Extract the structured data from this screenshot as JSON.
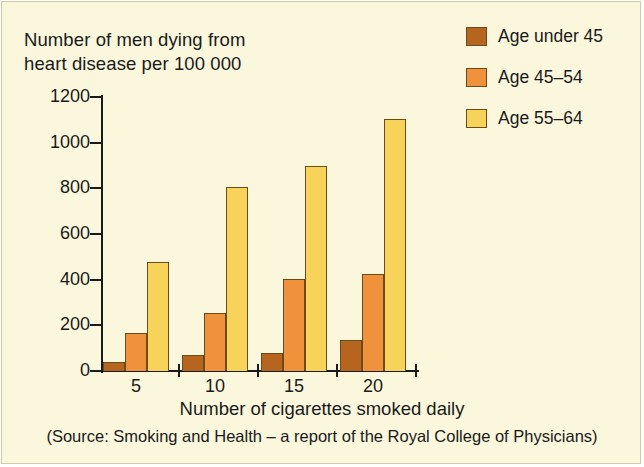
{
  "figure": {
    "background_color": "#faf7dd",
    "border_color": "#cfcaa8"
  },
  "legend": {
    "items": [
      {
        "label": "Age under 45",
        "color": "#b5651d",
        "swatch_name": "legend-swatch-age-under-45"
      },
      {
        "label": "Age 45–54",
        "color": "#f0913c",
        "swatch_name": "legend-swatch-age-45-54"
      },
      {
        "label": "Age 55–64",
        "color": "#f7d359",
        "swatch_name": "legend-swatch-age-55-64"
      }
    ]
  },
  "captions": {
    "y_title_line1": "Number of men dying from",
    "y_title_line2": "heart disease per 100 000",
    "x_title": "Number of cigarettes smoked daily",
    "source": "(Source: Smoking and Health – a report of the Royal College of Physicians)"
  },
  "chart_data": {
    "type": "bar",
    "title": "Number of men dying from heart disease per 100 000",
    "xlabel": "Number of cigarettes smoked daily",
    "ylabel": "Number of men dying from heart disease per 100 000",
    "categories": [
      "5",
      "10",
      "15",
      "20"
    ],
    "series": [
      {
        "name": "Age under 45",
        "color": "#b5651d",
        "values": [
          40,
          70,
          80,
          135
        ]
      },
      {
        "name": "Age 45–54",
        "color": "#f0913c",
        "values": [
          165,
          255,
          405,
          425
        ]
      },
      {
        "name": "Age 55–64",
        "color": "#f7d359",
        "values": [
          478,
          808,
          898,
          1105
        ]
      }
    ],
    "ylim": [
      0,
      1200
    ],
    "yticks": [
      0,
      200,
      400,
      600,
      800,
      1000,
      1200
    ],
    "ytick_labels": [
      "0",
      "200",
      "400",
      "600",
      "800",
      "1000",
      "1200"
    ],
    "xtick_labels": [
      "5",
      "10",
      "15",
      "20"
    ],
    "grid": false,
    "legend_position": "top-right"
  }
}
